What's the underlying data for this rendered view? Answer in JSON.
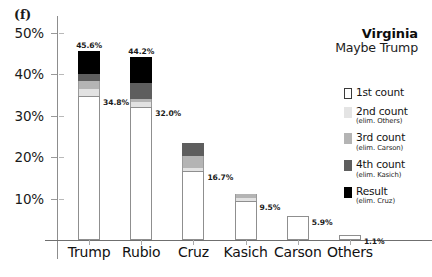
{
  "panel": {
    "label": "(f)"
  },
  "chart_data": {
    "type": "bar",
    "title": "Virginia",
    "subtitle": "Maybe Trump",
    "xlabel": "",
    "ylabel": "",
    "ylim": [
      0,
      54
    ],
    "grid": false,
    "stacked": true,
    "legend_position": "right",
    "ytick_labels": [
      "50%",
      "40%",
      "30%",
      "20%",
      "10%"
    ],
    "ytick_values": [
      50,
      40,
      30,
      20,
      10
    ],
    "categories": [
      "Trump",
      "Rubio",
      "Cruz",
      "Kasich",
      "Carson",
      "Others"
    ],
    "series": [
      {
        "name": "1st count",
        "values": [
          34.8,
          32.0,
          16.7,
          9.5,
          5.9,
          1.1
        ]
      },
      {
        "name": "2nd count",
        "values": [
          36.5,
          33.2,
          17.3,
          10.1,
          null,
          null
        ]
      },
      {
        "name": "3rd count",
        "values": [
          38.3,
          34.0,
          20.2,
          11.0,
          null,
          null
        ]
      },
      {
        "name": "4th count",
        "values": [
          39.9,
          37.8,
          23.5,
          null,
          null,
          null
        ]
      },
      {
        "name": "Result",
        "values": [
          45.6,
          44.2,
          null,
          null,
          null,
          null
        ]
      }
    ],
    "bars": [
      {
        "category": "Trump",
        "first_count": 34.8,
        "final": 45.6,
        "label_bottom": "34.8%",
        "label_top": "45.6%",
        "segments": [
          {
            "series": "1st count",
            "from": 0,
            "to": 34.8
          },
          {
            "series": "2nd count",
            "from": 34.8,
            "to": 36.5
          },
          {
            "series": "3rd count",
            "from": 36.5,
            "to": 38.3
          },
          {
            "series": "4th count",
            "from": 38.3,
            "to": 39.9
          },
          {
            "series": "Result",
            "from": 39.9,
            "to": 45.6
          }
        ]
      },
      {
        "category": "Rubio",
        "first_count": 32.0,
        "final": 44.2,
        "label_bottom": "32.0%",
        "label_top": "44.2%",
        "segments": [
          {
            "series": "1st count",
            "from": 0,
            "to": 32.0
          },
          {
            "series": "2nd count",
            "from": 32.0,
            "to": 33.2
          },
          {
            "series": "3rd count",
            "from": 33.2,
            "to": 34.0
          },
          {
            "series": "4th count",
            "from": 34.0,
            "to": 37.8
          },
          {
            "series": "Result",
            "from": 37.8,
            "to": 44.2
          }
        ]
      },
      {
        "category": "Cruz",
        "first_count": 16.7,
        "final": 23.5,
        "label_bottom": "16.7%",
        "label_top": "",
        "segments": [
          {
            "series": "1st count",
            "from": 0,
            "to": 16.7
          },
          {
            "series": "2nd count",
            "from": 16.7,
            "to": 17.3
          },
          {
            "series": "3rd count",
            "from": 17.3,
            "to": 20.2
          },
          {
            "series": "4th count",
            "from": 20.2,
            "to": 23.5
          }
        ]
      },
      {
        "category": "Kasich",
        "first_count": 9.5,
        "final": 11.0,
        "label_bottom": "9.5%",
        "label_top": "",
        "segments": [
          {
            "series": "1st count",
            "from": 0,
            "to": 9.5
          },
          {
            "series": "2nd count",
            "from": 9.5,
            "to": 10.1
          },
          {
            "series": "3rd count",
            "from": 10.1,
            "to": 11.0
          }
        ]
      },
      {
        "category": "Carson",
        "first_count": 5.9,
        "final": 5.9,
        "label_bottom": "5.9%",
        "label_top": "",
        "segments": [
          {
            "series": "1st count",
            "from": 0,
            "to": 5.9
          }
        ]
      },
      {
        "category": "Others",
        "first_count": 1.1,
        "final": 1.1,
        "label_bottom": "1.1%",
        "label_top": "",
        "segments": [
          {
            "series": "1st count",
            "from": 0,
            "to": 1.1
          }
        ]
      }
    ],
    "legend": [
      {
        "main": "1st count",
        "sub": "",
        "swatch": "sw-white",
        "color": "#ffffff"
      },
      {
        "main": "2nd count",
        "sub": "(elim. Others)",
        "swatch": "sw-c2",
        "color": "#e4e4e4"
      },
      {
        "main": "3rd count",
        "sub": "(elim. Carson)",
        "swatch": "sw-c3",
        "color": "#b4b4b4"
      },
      {
        "main": "4th count",
        "sub": "(elim. Kasich)",
        "swatch": "sw-c4",
        "color": "#5e5e5e"
      },
      {
        "main": "Result",
        "sub": "(elim. Cruz)",
        "swatch": "sw-res",
        "color": "#000000"
      }
    ]
  }
}
